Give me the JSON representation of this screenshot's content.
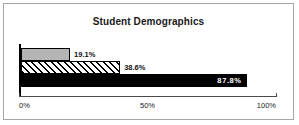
{
  "chart_data": {
    "type": "bar",
    "orientation": "horizontal",
    "title": "Student Demographics",
    "xlabel": "",
    "ylabel": "",
    "xlim": [
      0,
      100
    ],
    "grid": false,
    "legend": false,
    "categories": [
      "",
      "",
      ""
    ],
    "values": [
      19.1,
      38.6,
      87.8
    ],
    "tick_labels": [
      "0%",
      "50%",
      "100%"
    ],
    "tick_values": [
      0,
      50,
      100
    ],
    "bars": [
      {
        "value": 19.1,
        "label": "19.1%",
        "label_position": "outside",
        "fill": "solid-gray",
        "color": "#b5b5b5"
      },
      {
        "value": 38.6,
        "label": "38.6%",
        "label_position": "outside",
        "fill": "diagonal-hatch",
        "color": "#000000"
      },
      {
        "value": 87.8,
        "label": "87.8%",
        "label_position": "inside",
        "fill": "solid-black",
        "color": "#000000"
      }
    ]
  },
  "colors": {
    "frame_border": "#a6a6a6",
    "axis": "#4a4a4a",
    "text": "#1a1a1a",
    "inside_label": "#ffffff"
  }
}
